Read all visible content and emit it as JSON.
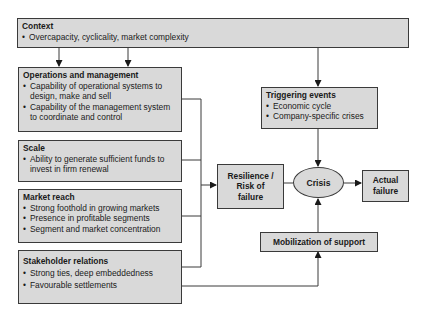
{
  "diagram": {
    "context": {
      "title": "Context",
      "items": [
        "Overcapacity, cyclicality, market complexity"
      ]
    },
    "operations": {
      "title": "Operations and management",
      "items": [
        "Capability of operational systems to design, make and sell",
        "Capability of the management system to coordinate and control"
      ]
    },
    "scale": {
      "title": "Scale",
      "items": [
        "Ability to generate sufficient funds to invest in firm renewal"
      ]
    },
    "market_reach": {
      "title": "Market reach",
      "items": [
        "Strong foothold in growing markets",
        "Presence in profitable segments",
        "Segment and market  concentration"
      ]
    },
    "stakeholder": {
      "title": "Stakeholder relations",
      "items": [
        "Strong ties, deep embeddedness",
        "Favourable settlements"
      ]
    },
    "triggering": {
      "title": "Triggering events",
      "items": [
        "Economic cycle",
        "Company-specific crises"
      ]
    },
    "resilience": {
      "label_lines": [
        "Resilience /",
        "Risk of",
        "failure"
      ]
    },
    "crisis": {
      "label": "Crisis"
    },
    "actual_failure": {
      "label_lines": [
        "Actual",
        "failure"
      ]
    },
    "mobilization": {
      "label": "Mobilization of support"
    },
    "colors": {
      "box_fill": "#d9d9d9",
      "line": "#3a3a3a",
      "background": "#ffffff"
    }
  }
}
